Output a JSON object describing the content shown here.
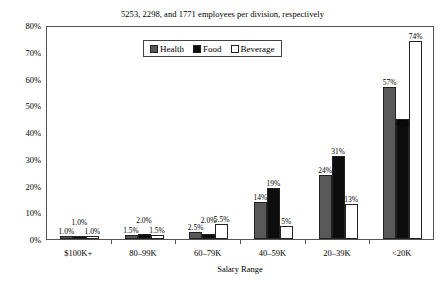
{
  "chart_data": {
    "type": "bar",
    "title": "5253, 2298, and 1771 employees per division, respectively",
    "xlabel": "Salary Range",
    "ylabel": "",
    "categories": [
      "$100K+",
      "80–99K",
      "60–79K",
      "40–59K",
      "20–39K",
      "<20K"
    ],
    "series": [
      {
        "name": "Health",
        "color": "#595959",
        "values": [
          1.0,
          1.5,
          2.5,
          14,
          24,
          57
        ],
        "labels": [
          "1.0%",
          "1.5%",
          "2.5%",
          "14%",
          "24%",
          "57%"
        ]
      },
      {
        "name": "Food",
        "color": "#0d0d0d",
        "values": [
          1.0,
          2.0,
          2.0,
          19,
          31,
          45
        ],
        "labels": [
          "1.0%",
          "2.0%",
          "2.0%",
          "19%",
          "31%",
          "45%"
        ]
      },
      {
        "name": "Beverage",
        "color": "#ffffff",
        "values": [
          1.0,
          1.5,
          5.5,
          5,
          13,
          74
        ],
        "labels": [
          "1.0%",
          "1.5%",
          "5.5%",
          "5%",
          "13%",
          "74%"
        ]
      }
    ],
    "ylim": [
      0,
      80
    ],
    "yticks": [
      0,
      10,
      20,
      30,
      40,
      50,
      60,
      70,
      80
    ],
    "ytick_labels": [
      "0%",
      "10%",
      "20%",
      "30%",
      "40%",
      "50%",
      "60%",
      "70%",
      "80%"
    ],
    "grid": false,
    "legend_position": "top-center"
  },
  "legend": {
    "entries": [
      {
        "label": "Health"
      },
      {
        "label": "Food"
      },
      {
        "label": "Beverage"
      }
    ]
  }
}
